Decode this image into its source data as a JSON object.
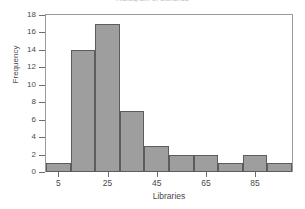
{
  "chart_data": {
    "type": "bar",
    "title": "Histogram of Libraries",
    "xlabel": "Libraries",
    "ylabel": "Frequency",
    "categories": [
      "0-10",
      "10-20",
      "20-30",
      "30-40",
      "40-50",
      "50-60",
      "60-70",
      "70-80",
      "80-90",
      "90-100"
    ],
    "bin_edges": [
      0,
      10,
      20,
      30,
      40,
      50,
      60,
      70,
      80,
      90,
      100
    ],
    "bin_width": 10,
    "values": [
      1,
      14,
      17,
      7,
      3,
      2,
      2,
      1,
      2,
      1
    ],
    "x": [
      5,
      15,
      25,
      35,
      45,
      55,
      65,
      75,
      85,
      95
    ],
    "xlim": [
      0,
      100
    ],
    "ylim": [
      0,
      18
    ],
    "ytick_labels": [
      "0",
      "2",
      "4",
      "6",
      "8",
      "10",
      "12",
      "14",
      "16",
      "18"
    ],
    "ytick_values": [
      0,
      2,
      4,
      6,
      8,
      10,
      12,
      14,
      16,
      18
    ],
    "xtick_labels": [
      "5",
      "25",
      "45",
      "65",
      "85"
    ],
    "xtick_values": [
      5,
      25,
      45,
      65,
      85
    ],
    "grid": false,
    "legend": "none",
    "bar_color": "#9e9e9e",
    "bar_edge_color": "#5c5c5c",
    "axis_color": "#6e6e6e",
    "background": "#ffffff"
  }
}
